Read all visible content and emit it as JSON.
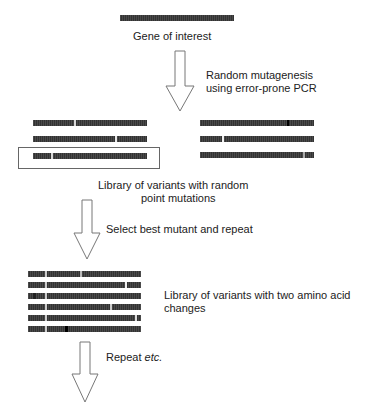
{
  "labels": {
    "gene": "Gene of interest",
    "step1": [
      "Random mutagenesis",
      "using error-prone PCR"
    ],
    "library1": [
      "Library of variants with random",
      "point mutations"
    ],
    "step2": "Select best mutant and repeat",
    "library2": [
      "Library of variants with two amino acid",
      "changes"
    ],
    "step3_main": "Repeat ",
    "step3_italic": "etc."
  },
  "colors": {
    "bar": "#333333",
    "mutation_light": "#d8d8d8",
    "mutation_dark": "#000000",
    "arrow_stroke": "#777777"
  }
}
